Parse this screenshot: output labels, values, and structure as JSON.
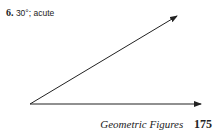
{
  "problem": {
    "number": "6.",
    "answer": "30°; acute"
  },
  "figure": {
    "type": "angle",
    "measure_degrees": 30,
    "classification": "acute",
    "vertex": [
      30,
      104
    ],
    "ray_upper_end": [
      177,
      16
    ],
    "ray_lower_end": [
      201,
      104
    ],
    "stroke_color": "#222222"
  },
  "footer": {
    "section_title": "Geometric Figures",
    "page_number": "175"
  }
}
